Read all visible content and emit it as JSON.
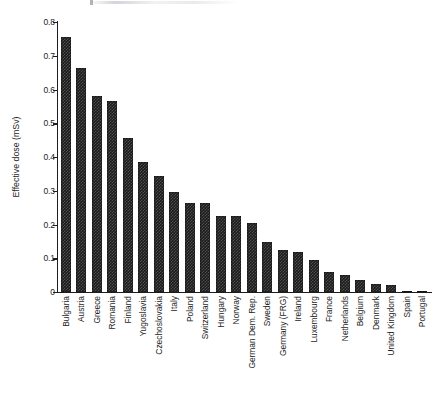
{
  "chart_data": {
    "type": "bar",
    "title": "",
    "subtitle": "",
    "xlabel": "",
    "ylabel": "Effective dose (mSv)",
    "ylim": [
      0,
      0.8
    ],
    "ytick_labels": [
      "0",
      "0.1",
      "0.2",
      "0.3",
      "0.4",
      "0.5",
      "0.6",
      "0.7",
      "0.8"
    ],
    "ytick_values": [
      0,
      0.1,
      0.2,
      0.3,
      0.4,
      0.5,
      0.6,
      0.7,
      0.8
    ],
    "grid": false,
    "legend": false,
    "legend_position": "none",
    "bar_color": "#1b1b1b",
    "categories": [
      "Bulgaria",
      "Austria",
      "Greece",
      "Romania",
      "Finland",
      "Yugoslavia",
      "Czechoslovakia",
      "Italy",
      "Poland",
      "Switzerland",
      "Hungary",
      "Norway",
      "German Dem. Rep.",
      "Sweden",
      "Germany (FRG)",
      "Ireland",
      "Luxembourg",
      "France",
      "Netherlands",
      "Belgium",
      "Denmark",
      "United Kingdom",
      "Spain",
      "Portugal"
    ],
    "values": [
      0.755,
      0.665,
      0.58,
      0.565,
      0.455,
      0.385,
      0.345,
      0.295,
      0.265,
      0.265,
      0.225,
      0.225,
      0.205,
      0.148,
      0.125,
      0.118,
      0.095,
      0.06,
      0.05,
      0.035,
      0.025,
      0.022,
      0.003,
      0.001
    ]
  }
}
